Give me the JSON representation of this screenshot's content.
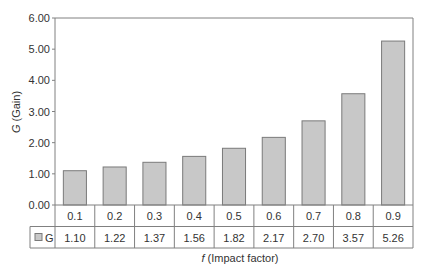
{
  "chart_data": {
    "type": "bar",
    "title": "",
    "xlabel": "f (Impact factor)",
    "xlabel_italic_part": "f",
    "xlabel_rest": " (Impact factor)",
    "ylabel": "G (Gain)",
    "ylabel_italic_part": "G",
    "ylabel_rest": " (Gain)",
    "ylim": [
      0,
      6
    ],
    "yticks": [
      "0.00",
      "1.00",
      "2.00",
      "3.00",
      "4.00",
      "5.00",
      "6.00"
    ],
    "grid": false,
    "legend_position": "data-table",
    "categories": [
      "0.1",
      "0.2",
      "0.3",
      "0.4",
      "0.5",
      "0.6",
      "0.7",
      "0.8",
      "0.9"
    ],
    "series": [
      {
        "name": "G",
        "color": "#c8c8c8",
        "values": [
          1.1,
          1.22,
          1.37,
          1.56,
          1.82,
          2.17,
          2.7,
          3.57,
          5.26
        ],
        "labels": [
          "1.10",
          "1.22",
          "1.37",
          "1.56",
          "1.82",
          "2.17",
          "2.70",
          "3.57",
          "5.26"
        ]
      }
    ]
  },
  "colors": {
    "bar_fill": "#c8c8c8",
    "bar_stroke": "#7a7a7a",
    "axis": "#808080",
    "text": "#333333"
  }
}
